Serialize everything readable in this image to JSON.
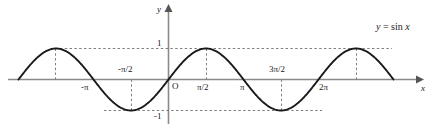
{
  "figure": {
    "equation_label": "y = sin x",
    "axis_labels": {
      "x": "x",
      "y": "y",
      "origin": "O"
    },
    "colors": {
      "curve": "#1a1a1a",
      "axis": "#808080",
      "dashed": "#808080",
      "text": "#1a1a1a",
      "background": "#ffffff"
    }
  },
  "chart_data": {
    "type": "line",
    "xlabel": "x",
    "ylabel": "y",
    "function": "y = sin x",
    "xlim": [
      -6.2832,
      9.4248
    ],
    "ylim": [
      -1.45,
      1.55
    ],
    "grid": false,
    "legend": "none",
    "annotations": [
      "y = sin x"
    ],
    "y_ticks": [
      {
        "value": 1,
        "label": "1"
      },
      {
        "value": -1,
        "label": "-1"
      }
    ],
    "x_ticks": [
      {
        "value": -3.1416,
        "label": "-π",
        "position": "below"
      },
      {
        "value": -1.5708,
        "label": "-π/2",
        "position": "above"
      },
      {
        "value": 0,
        "label": "O",
        "position": "below"
      },
      {
        "value": 1.5708,
        "label": "π/2",
        "position": "below"
      },
      {
        "value": 3.1416,
        "label": "π",
        "position": "below"
      },
      {
        "value": 4.7124,
        "label": "3π/2",
        "position": "above"
      },
      {
        "value": 6.2832,
        "label": "2π",
        "position": "below"
      }
    ],
    "dashed_guides": {
      "horizontal": [
        1,
        -1
      ],
      "vertical_at_extrema": [
        -4.7124,
        -1.5708,
        1.5708,
        4.7124,
        7.854
      ]
    },
    "extrema": [
      {
        "x": -4.7124,
        "y": 1,
        "type": "maximum"
      },
      {
        "x": -1.5708,
        "y": -1,
        "type": "minimum"
      },
      {
        "x": 1.5708,
        "y": 1,
        "type": "maximum"
      },
      {
        "x": 4.7124,
        "y": -1,
        "type": "minimum"
      },
      {
        "x": 7.854,
        "y": 1,
        "type": "maximum"
      }
    ],
    "zeros": [
      -6.2832,
      -3.1416,
      0,
      3.1416,
      6.2832,
      9.4248
    ],
    "series": [
      {
        "name": "y = sin x",
        "x": [
          -6.2832,
          -5.8905,
          -5.4978,
          -5.1051,
          -4.7124,
          -4.3197,
          -3.927,
          -3.5343,
          -3.1416,
          -2.7489,
          -2.3562,
          -1.9635,
          -1.5708,
          -1.1781,
          -0.7854,
          -0.3927,
          0,
          0.3927,
          0.7854,
          1.1781,
          1.5708,
          1.9635,
          2.3562,
          2.7489,
          3.1416,
          3.5343,
          3.927,
          4.3197,
          4.7124,
          5.1051,
          5.4978,
          5.8905,
          6.2832,
          6.6759,
          7.0686,
          7.4613,
          7.854,
          8.2467,
          8.6394,
          9.0321,
          9.4248
        ],
        "y": [
          0,
          0.3827,
          0.7071,
          0.9239,
          1,
          0.9239,
          0.7071,
          0.3827,
          0,
          -0.3827,
          -0.7071,
          -0.9239,
          -1,
          -0.9239,
          -0.7071,
          -0.3827,
          0,
          0.3827,
          0.7071,
          0.9239,
          1,
          0.9239,
          0.7071,
          0.3827,
          0,
          -0.3827,
          -0.7071,
          -0.9239,
          -1,
          -0.9239,
          -0.7071,
          -0.3827,
          0,
          0.3827,
          0.7071,
          0.9239,
          1,
          0.9239,
          0.7071,
          0.3827,
          0
        ]
      }
    ]
  },
  "labels": {
    "one": "1",
    "neg_one": "-1",
    "neg_pi": "-π",
    "neg_pi_half": "-π/2",
    "origin": "O",
    "pi_half": "π/2",
    "pi": "π",
    "three_pi_half": "3π/2",
    "two_pi": "2π",
    "axis_x": "x",
    "axis_y": "y",
    "equation_y": "y",
    "equation_eq": "=",
    "equation_sin": "sin",
    "equation_var": "x"
  }
}
